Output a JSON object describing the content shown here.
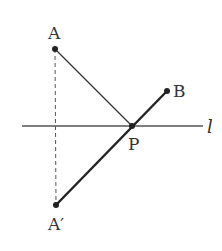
{
  "diagram": {
    "points": {
      "A": {
        "label": "A",
        "x": 55,
        "y": 49
      },
      "A_prime": {
        "label": "A′",
        "x": 56,
        "y": 205
      },
      "P": {
        "label": "P",
        "x": 132,
        "y": 126
      },
      "B": {
        "label": "B",
        "x": 167,
        "y": 91
      }
    },
    "line": {
      "label": "l",
      "x1": 22,
      "x2": 203,
      "y": 126
    },
    "segments": [
      {
        "from": "A",
        "to": "P",
        "style": "thin solid"
      },
      {
        "from": "A_prime",
        "to": "B",
        "style": "thick solid"
      },
      {
        "from": "A",
        "to": "A_prime",
        "style": "dashed"
      }
    ],
    "colors": {
      "stroke": "#333333",
      "background": "#ffffff"
    }
  }
}
